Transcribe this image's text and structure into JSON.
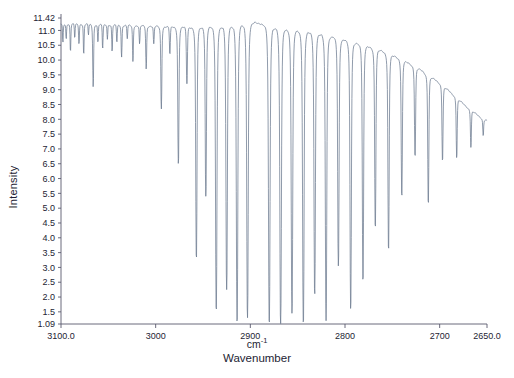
{
  "chart_data": {
    "type": "line",
    "title": "",
    "xlabel": "Wavenumber",
    "xunit": "cm",
    "xunit_sup": "-1",
    "ylabel": "Intensity",
    "xlim": [
      3100.0,
      2650.0
    ],
    "ylim": [
      1.09,
      11.42
    ],
    "x_reversed": true,
    "grid": false,
    "legend": null,
    "xticks": [
      {
        "value": 3100.0,
        "label": "3100.0"
      },
      {
        "value": 3000.0,
        "label": "3000"
      },
      {
        "value": 2900.0,
        "label": "2900"
      },
      {
        "value": 2800.0,
        "label": "2800"
      },
      {
        "value": 2700.0,
        "label": "2700"
      },
      {
        "value": 2650.0,
        "label": "2650.0"
      }
    ],
    "yticks": [
      {
        "value": 11.42,
        "label": "11.42"
      },
      {
        "value": 11.0,
        "label": "11.0"
      },
      {
        "value": 10.5,
        "label": "10.5"
      },
      {
        "value": 10.0,
        "label": "10.0"
      },
      {
        "value": 9.5,
        "label": "9.5"
      },
      {
        "value": 9.0,
        "label": "9.0"
      },
      {
        "value": 8.5,
        "label": "8.5"
      },
      {
        "value": 8.0,
        "label": "8.0"
      },
      {
        "value": 7.5,
        "label": "7.5"
      },
      {
        "value": 7.0,
        "label": "7.0"
      },
      {
        "value": 6.5,
        "label": "6.5"
      },
      {
        "value": 6.0,
        "label": "6.0"
      },
      {
        "value": 5.5,
        "label": "5.5"
      },
      {
        "value": 5.0,
        "label": "5.0"
      },
      {
        "value": 4.5,
        "label": "4.5"
      },
      {
        "value": 4.0,
        "label": "4.0"
      },
      {
        "value": 3.5,
        "label": "3.5"
      },
      {
        "value": 3.0,
        "label": "3.0"
      },
      {
        "value": 2.5,
        "label": "2.5"
      },
      {
        "value": 2.0,
        "label": "2.0"
      },
      {
        "value": 1.5,
        "label": "1.5"
      },
      {
        "value": 1.09,
        "label": "1.09"
      }
    ],
    "series": [
      {
        "name": "transmission",
        "color": "#6b7a8f",
        "baseline": [
          {
            "x": 3100.0,
            "y": 11.22
          },
          {
            "x": 3080.0,
            "y": 11.22
          },
          {
            "x": 3060.0,
            "y": 11.2
          },
          {
            "x": 3040.0,
            "y": 11.18
          },
          {
            "x": 3020.0,
            "y": 11.16
          },
          {
            "x": 3000.0,
            "y": 11.14
          },
          {
            "x": 2980.0,
            "y": 11.12
          },
          {
            "x": 2960.0,
            "y": 11.12
          },
          {
            "x": 2940.0,
            "y": 11.14
          },
          {
            "x": 2920.0,
            "y": 11.2
          },
          {
            "x": 2905.0,
            "y": 11.26
          },
          {
            "x": 2895.0,
            "y": 11.26
          },
          {
            "x": 2880.0,
            "y": 11.18
          },
          {
            "x": 2860.0,
            "y": 11.08
          },
          {
            "x": 2840.0,
            "y": 10.98
          },
          {
            "x": 2820.0,
            "y": 10.86
          },
          {
            "x": 2800.0,
            "y": 10.7
          },
          {
            "x": 2780.0,
            "y": 10.52
          },
          {
            "x": 2760.0,
            "y": 10.3
          },
          {
            "x": 2740.0,
            "y": 10.02
          },
          {
            "x": 2720.0,
            "y": 9.66
          },
          {
            "x": 2700.0,
            "y": 9.22
          },
          {
            "x": 2690.0,
            "y": 8.95
          },
          {
            "x": 2680.0,
            "y": 8.66
          },
          {
            "x": 2670.0,
            "y": 8.38
          },
          {
            "x": 2660.0,
            "y": 8.14
          },
          {
            "x": 2655.0,
            "y": 8.02
          },
          {
            "x": 2650.0,
            "y": 7.95
          }
        ],
        "lines": [
          {
            "x": 3098.0,
            "depth": 10.6,
            "width": 1.1
          },
          {
            "x": 3094.5,
            "depth": 10.72,
            "width": 1.1
          },
          {
            "x": 3090.0,
            "depth": 10.3,
            "width": 1.2
          },
          {
            "x": 3085.5,
            "depth": 10.75,
            "width": 1.1
          },
          {
            "x": 3081.0,
            "depth": 10.55,
            "width": 1.2
          },
          {
            "x": 3076.0,
            "depth": 10.2,
            "width": 1.2
          },
          {
            "x": 3071.0,
            "depth": 10.85,
            "width": 1.1
          },
          {
            "x": 3066.0,
            "depth": 9.1,
            "width": 1.4
          },
          {
            "x": 3061.0,
            "depth": 10.6,
            "width": 1.2
          },
          {
            "x": 3056.0,
            "depth": 10.4,
            "width": 1.2
          },
          {
            "x": 3051.0,
            "depth": 10.7,
            "width": 1.1
          },
          {
            "x": 3046.0,
            "depth": 10.3,
            "width": 1.2
          },
          {
            "x": 3041.0,
            "depth": 10.6,
            "width": 1.2
          },
          {
            "x": 3036.0,
            "depth": 10.1,
            "width": 1.3
          },
          {
            "x": 3030.0,
            "depth": 10.72,
            "width": 1.2
          },
          {
            "x": 3024.0,
            "depth": 9.95,
            "width": 1.3
          },
          {
            "x": 3017.0,
            "depth": 10.55,
            "width": 1.2
          },
          {
            "x": 3010.0,
            "depth": 9.7,
            "width": 1.4
          },
          {
            "x": 3002.0,
            "depth": 10.55,
            "width": 1.3
          },
          {
            "x": 2994.0,
            "depth": 8.35,
            "width": 1.6
          },
          {
            "x": 2985.0,
            "depth": 10.2,
            "width": 1.4
          },
          {
            "x": 2976.0,
            "depth": 6.5,
            "width": 1.8
          },
          {
            "x": 2967.0,
            "depth": 9.2,
            "width": 1.6
          },
          {
            "x": 2957.0,
            "depth": 3.3,
            "width": 2.0
          },
          {
            "x": 2947.0,
            "depth": 5.4,
            "width": 1.9
          },
          {
            "x": 2936.0,
            "depth": 1.55,
            "width": 2.2
          },
          {
            "x": 2925.0,
            "depth": 2.25,
            "width": 2.2
          },
          {
            "x": 2914.0,
            "depth": 1.15,
            "width": 2.3
          },
          {
            "x": 2903.0,
            "depth": 1.3,
            "width": 2.3
          },
          {
            "x": 2880.0,
            "depth": 1.12,
            "width": 2.4
          },
          {
            "x": 2868.0,
            "depth": 1.1,
            "width": 2.4
          },
          {
            "x": 2856.0,
            "depth": 1.45,
            "width": 2.3
          },
          {
            "x": 2844.0,
            "depth": 1.12,
            "width": 2.3
          },
          {
            "x": 2832.0,
            "depth": 2.1,
            "width": 2.2
          },
          {
            "x": 2820.0,
            "depth": 1.2,
            "width": 2.2
          },
          {
            "x": 2807.0,
            "depth": 3.05,
            "width": 2.1
          },
          {
            "x": 2794.0,
            "depth": 1.6,
            "width": 2.1
          },
          {
            "x": 2781.0,
            "depth": 2.55,
            "width": 2.0
          },
          {
            "x": 2768.0,
            "depth": 4.35,
            "width": 1.9
          },
          {
            "x": 2754.0,
            "depth": 3.6,
            "width": 1.9
          },
          {
            "x": 2740.0,
            "depth": 5.4,
            "width": 1.8
          },
          {
            "x": 2726.0,
            "depth": 6.75,
            "width": 1.7
          },
          {
            "x": 2712.0,
            "depth": 5.15,
            "width": 1.7
          },
          {
            "x": 2697.0,
            "depth": 6.6,
            "width": 1.6
          },
          {
            "x": 2682.0,
            "depth": 6.7,
            "width": 1.5
          },
          {
            "x": 2667.0,
            "depth": 7.05,
            "width": 1.4
          },
          {
            "x": 2654.0,
            "depth": 7.45,
            "width": 1.3
          }
        ]
      }
    ]
  },
  "axes": {
    "ylabel_text": "Intensity",
    "xlabel_text": "Wavenumber"
  }
}
